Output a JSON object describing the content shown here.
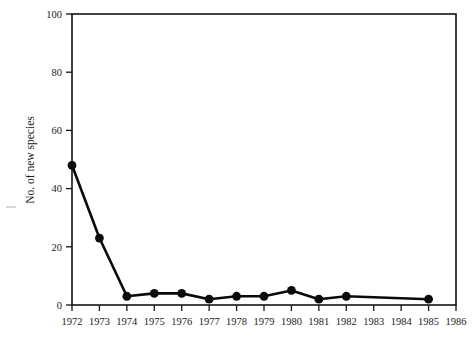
{
  "chart_data": {
    "type": "line",
    "title": "",
    "subtitle": "",
    "xlabel": "",
    "ylabel": "No. of new species",
    "x": [
      1972,
      1973,
      1974,
      1975,
      1976,
      1977,
      1978,
      1979,
      1980,
      1981,
      1982,
      1985
    ],
    "values": [
      48,
      23,
      3,
      4,
      4,
      2,
      3,
      3,
      5,
      2,
      3,
      2
    ],
    "series": [
      {
        "name": "No. of new species",
        "x": [
          1972,
          1973,
          1974,
          1975,
          1976,
          1977,
          1978,
          1979,
          1980,
          1981,
          1982,
          1985
        ],
        "values": [
          48,
          23,
          3,
          4,
          4,
          2,
          3,
          3,
          5,
          2,
          3,
          2
        ]
      }
    ],
    "xlim": [
      1972,
      1986
    ],
    "ylim": [
      0,
      100
    ],
    "xticks": [
      1972,
      1973,
      1974,
      1975,
      1976,
      1977,
      1978,
      1979,
      1980,
      1981,
      1982,
      1983,
      1984,
      1985,
      1986
    ],
    "xtick_labels": [
      "1972",
      "1973",
      "1974",
      "1975",
      "1976",
      "1977",
      "1978",
      "1979",
      "1980",
      "1981",
      "1982",
      "1983",
      "1984",
      "1985",
      "1986"
    ],
    "yticks": [
      0,
      20,
      40,
      60,
      80,
      100
    ],
    "ytick_labels": [
      "0",
      "20",
      "40",
      "60",
      "80",
      "100"
    ],
    "grid": false,
    "legend": false,
    "legend_position": "none",
    "marker": "filled-circle",
    "line_color": "#0a0a0a",
    "marker_color": "#0a0a0a",
    "background_color": "#ffffff",
    "axis_color": "#141414",
    "frame": "box",
    "annotations": []
  }
}
